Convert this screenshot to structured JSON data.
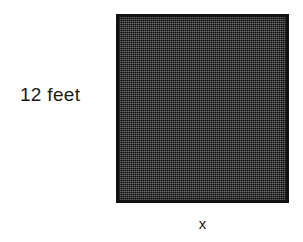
{
  "figure": {
    "type": "shaded-square-diagram",
    "shape_name": "square",
    "fill_color": "#4c4c4c",
    "border_color": "#111111",
    "background_color": "#ffffff"
  },
  "labels": {
    "height": "12 feet",
    "width": "x"
  }
}
